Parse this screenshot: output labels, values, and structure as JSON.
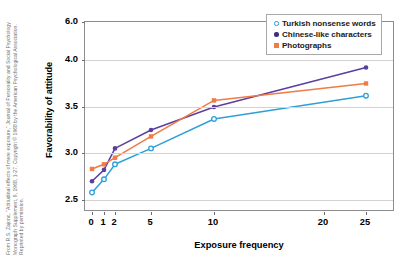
{
  "credit": {
    "text": "From R.S. Zajonc, \"Attitudinal effects of mere exposure,\" Journal of Personality and Social Psychology Monograph Supplement, 9, 1968, 1-27. Copyright © 1968 by the American Psychological Association. Reprinted by permission."
  },
  "chart_data": {
    "type": "line",
    "title": "",
    "xlabel": "Exposure frequency",
    "ylabel": "Favorability of attitude",
    "x": [
      0,
      1,
      2,
      5,
      10,
      25
    ],
    "xtick_labels": [
      "0",
      "1",
      "2",
      "5",
      "10",
      "20",
      "25"
    ],
    "xtick_values": [
      0,
      1,
      2,
      5,
      10,
      20,
      25
    ],
    "ytick_labels": [
      "6.0",
      "4.0",
      "3.5",
      "3.0",
      "2.5"
    ],
    "ytick_values": [
      6.0,
      4.0,
      3.5,
      3.0,
      2.5
    ],
    "ylim": [
      2.5,
      6.0
    ],
    "grid": true,
    "legend_position": "top-right",
    "series": [
      {
        "name": "Turkish nonsense words",
        "color": "#2e9fd8",
        "marker": "open-circle",
        "values": [
          2.58,
          2.72,
          2.88,
          3.05,
          3.37,
          3.62
        ]
      },
      {
        "name": "Chinese-like characters",
        "color": "#5b3f9e",
        "marker": "filled-circle",
        "values": [
          2.7,
          2.82,
          3.05,
          3.25,
          3.5,
          3.92
        ]
      },
      {
        "name": "Photographs",
        "color": "#ef7b45",
        "marker": "square",
        "values": [
          2.83,
          2.88,
          2.95,
          3.18,
          3.57,
          3.75
        ]
      }
    ]
  }
}
